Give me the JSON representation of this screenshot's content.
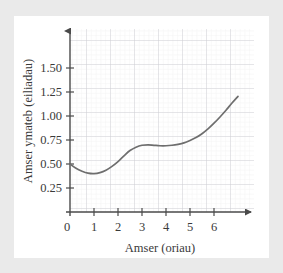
{
  "chart_data": {
    "type": "line",
    "title": "",
    "subtitle": "",
    "xlabel": "Amser (oriau)",
    "ylabel": "Amser ymateb (eiliadau)",
    "xlim": [
      0,
      7.5
    ],
    "ylim": [
      0,
      1.68
    ],
    "xticks": [
      0,
      1,
      2,
      3,
      4,
      5,
      6
    ],
    "xtick_labels": [
      "0",
      "1",
      "2",
      "3",
      "4",
      "5",
      "6"
    ],
    "yticks": [
      0.25,
      0.5,
      0.75,
      1.0,
      1.25,
      1.5
    ],
    "ytick_labels": [
      "0.25",
      "0.50",
      "0.75",
      "1.00",
      "1.25",
      "1.50"
    ],
    "grid": true,
    "grid_major_step_x": 1,
    "grid_major_step_y": 0.25,
    "grid_minor_divisions": 5,
    "legend": null,
    "legend_position": "none",
    "series": [
      {
        "name": "Amser ymateb",
        "color": "#6e6e6e",
        "x": [
          0.0,
          0.25,
          0.5,
          0.75,
          1.0,
          1.25,
          1.5,
          1.75,
          2.0,
          2.25,
          2.5,
          2.75,
          3.0,
          3.25,
          3.5,
          3.75,
          4.0,
          4.25,
          4.5,
          4.75,
          5.0,
          5.25,
          5.5,
          5.75,
          6.0,
          6.25,
          6.5,
          6.75,
          7.0
        ],
        "y": [
          0.5,
          0.455,
          0.425,
          0.405,
          0.4,
          0.41,
          0.435,
          0.475,
          0.525,
          0.585,
          0.64,
          0.675,
          0.695,
          0.7,
          0.695,
          0.69,
          0.69,
          0.695,
          0.705,
          0.72,
          0.745,
          0.775,
          0.815,
          0.865,
          0.925,
          0.99,
          1.06,
          1.135,
          1.205
        ]
      }
    ]
  },
  "axes": {
    "x_arrow": "arrow-right",
    "y_arrow": "arrow-up",
    "axis_color": "#4a4a4a",
    "grid_major_color": "#cfcfd6",
    "grid_minor_color": "#ececed"
  },
  "colors": {
    "page_background": "#eaeaea",
    "card_background": "#ffffff",
    "curve": "#6e6e6e",
    "text": "#3a3a3a"
  }
}
